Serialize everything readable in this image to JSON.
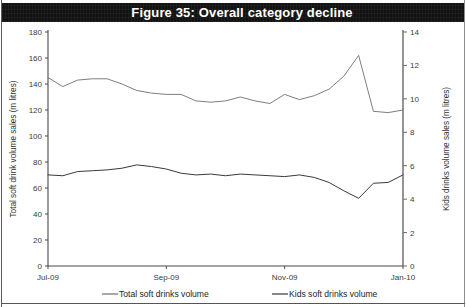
{
  "figure": {
    "title": "Figure 35: Overall category decline",
    "title_bg": "#121212",
    "title_color": "#ffffff"
  },
  "chart_data": {
    "type": "line",
    "title": "Figure 35: Overall category decline",
    "xlabel": "",
    "grid": false,
    "legend_position": "bottom",
    "x_ticks": [
      "Jul-09",
      "Sep-09",
      "Nov-09",
      "Jan-10"
    ],
    "x_tick_positions": [
      0,
      8,
      16,
      24
    ],
    "x_range": [
      0,
      24
    ],
    "left_axis": {
      "label": "Total soft drink volume sales (m litres)",
      "ylim": [
        0,
        180
      ],
      "ticks": [
        0,
        20,
        40,
        60,
        80,
        100,
        120,
        140,
        160,
        180
      ]
    },
    "right_axis": {
      "label": "Kids drinks volume sales (m litres)",
      "ylim": [
        0,
        14
      ],
      "ticks": [
        0,
        2,
        4,
        6,
        8,
        10,
        12,
        14
      ]
    },
    "series": [
      {
        "name": "Total soft drinks volume",
        "axis": "left",
        "color": "#6e6e6e",
        "x": [
          0,
          1,
          2,
          3,
          4,
          5,
          6,
          7,
          8,
          9,
          10,
          11,
          12,
          13,
          14,
          15,
          16,
          17,
          18,
          19,
          20,
          21,
          22,
          23,
          24
        ],
        "values": [
          145,
          138,
          143,
          144,
          144,
          140,
          135,
          133,
          132,
          132,
          127,
          126,
          127,
          130,
          127,
          125,
          132,
          128,
          131,
          136,
          146,
          162,
          119,
          118,
          120
        ]
      },
      {
        "name": "Kids soft drinks volume",
        "axis": "right",
        "color": "#3a3a3a",
        "x": [
          0,
          1,
          2,
          3,
          4,
          5,
          6,
          7,
          8,
          9,
          10,
          11,
          12,
          13,
          14,
          15,
          16,
          17,
          18,
          19,
          20,
          21,
          22,
          23,
          24
        ],
        "values": [
          5.45,
          5.4,
          5.65,
          5.7,
          5.75,
          5.85,
          6.05,
          5.95,
          5.8,
          5.55,
          5.45,
          5.5,
          5.4,
          5.5,
          5.45,
          5.4,
          5.35,
          5.45,
          5.3,
          5.0,
          4.5,
          4.05,
          4.95,
          5.0,
          5.45
        ]
      }
    ]
  },
  "legend": [
    {
      "label": "Total soft drinks volume",
      "color": "#6e6e6e"
    },
    {
      "label": "Kids soft drinks volume",
      "color": "#3a3a3a"
    }
  ],
  "axis_labels": {
    "left": "Total soft drink volume sales (m litres)",
    "right": "Kids drinks volume sales (m litres)"
  }
}
